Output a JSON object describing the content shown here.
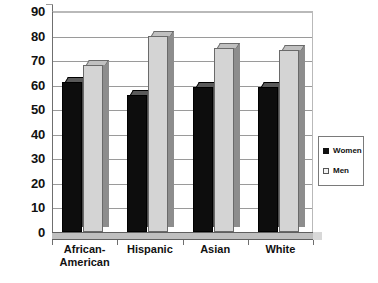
{
  "chart_data": {
    "type": "bar",
    "title": "",
    "subtitle": "",
    "xlabel": "",
    "ylabel": "",
    "categories": [
      "African-\nAmerican",
      "Hispanic",
      "Asian",
      "White"
    ],
    "series": [
      {
        "name": "Women",
        "values": [
          61,
          56,
          59,
          59
        ],
        "color": "#0d0d0d"
      },
      {
        "name": "Men",
        "values": [
          68,
          80,
          75,
          74
        ],
        "color": "#d4d4d4"
      }
    ],
    "ylim": [
      0,
      90
    ],
    "ytick_values": [
      90,
      80,
      70,
      60,
      50,
      40,
      30,
      20,
      10,
      0
    ],
    "ytick_labels": [
      "90",
      "80",
      "70",
      "60",
      "50",
      "40",
      "30",
      "20",
      "10",
      "0"
    ],
    "ytick_step": 10,
    "grid": true,
    "grid_axis": "y",
    "legend_position": "right",
    "style": "3d-clustered-column"
  },
  "legend": {
    "entries": [
      {
        "label": "Women",
        "marker": "filled-square"
      },
      {
        "label": "Men",
        "marker": "hollow-square"
      }
    ]
  },
  "colors": {
    "women_bar": "#0d0d0d",
    "men_bar": "#d4d4d4",
    "gridline": "#9a9a9a",
    "axis": "#6f6f6f",
    "text": "#111111",
    "background": "#ffffff"
  }
}
